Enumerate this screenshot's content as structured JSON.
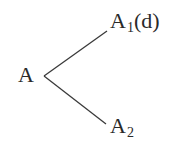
{
  "diagram": {
    "type": "tree",
    "root": {
      "label": "A"
    },
    "children": [
      {
        "label": "A",
        "subscript": "1",
        "suffix": "(d)"
      },
      {
        "label": "A",
        "subscript": "2",
        "suffix": ""
      }
    ],
    "edges": [
      {
        "from": "A",
        "to": "A1(d)"
      },
      {
        "from": "A",
        "to": "A2"
      }
    ],
    "colors": {
      "line": "#3a3a3a",
      "text": "#2a2a2a",
      "background": "#ffffff"
    }
  }
}
